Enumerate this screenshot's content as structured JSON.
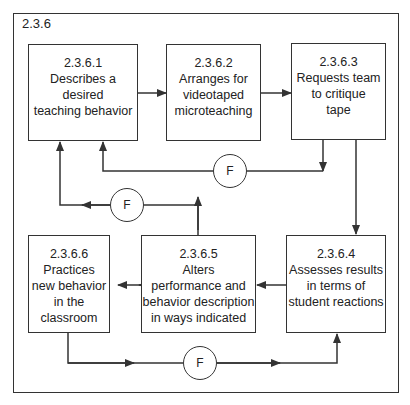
{
  "diagram": {
    "frame_label": "2.3.6",
    "boxes": [
      {
        "id": "2.3.6.1",
        "lines": [
          "Describes a",
          "desired",
          "teaching behavior"
        ]
      },
      {
        "id": "2.3.6.2",
        "lines": [
          "Arranges for",
          "videotaped",
          "microteaching"
        ]
      },
      {
        "id": "2.3.6.3",
        "lines": [
          "Requests team",
          "to critique",
          "tape"
        ]
      },
      {
        "id": "2.3.6.4",
        "lines": [
          "Assesses results",
          "in terms of",
          "student reactions"
        ]
      },
      {
        "id": "2.3.6.5",
        "lines": [
          "Alters",
          "performance and",
          "behavior description",
          "in ways indicated"
        ]
      },
      {
        "id": "2.3.6.6",
        "lines": [
          "Practices",
          "new behavior",
          "in the",
          "classroom"
        ]
      }
    ],
    "feedback_nodes": [
      {
        "label": "F",
        "from": "2.3.6.3",
        "to": "2.3.6.1"
      },
      {
        "label": "F",
        "from": "2.3.6.5",
        "to": "2.3.6.1"
      },
      {
        "label": "F",
        "from": "2.3.6.6",
        "to": "2.3.6.4"
      }
    ],
    "edges": [
      {
        "from": "2.3.6.1",
        "to": "2.3.6.2"
      },
      {
        "from": "2.3.6.2",
        "to": "2.3.6.3"
      },
      {
        "from": "2.3.6.3",
        "to": "2.3.6.4"
      },
      {
        "from": "2.3.6.4",
        "to": "2.3.6.5"
      },
      {
        "from": "2.3.6.5",
        "to": "2.3.6.6"
      }
    ],
    "colors": {
      "stroke": "#333333",
      "background": "#ffffff",
      "text": "#222222"
    }
  }
}
